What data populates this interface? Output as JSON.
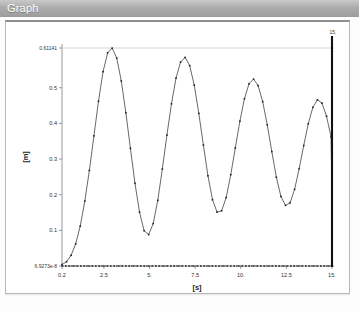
{
  "window": {
    "title": "Graph"
  },
  "chart_data": {
    "type": "line",
    "title": "",
    "xlabel": "[s]",
    "ylabel": "[m]",
    "xlim": [
      0.2,
      15.0
    ],
    "ylim": [
      6.9273e-08,
      0.61141
    ],
    "grid": false,
    "legend": "none",
    "x_tick_labels": [
      "0.2",
      "2.5",
      "5.",
      "7.5",
      "10.",
      "12.5",
      "15."
    ],
    "x_tick_values": [
      0.2,
      2.5,
      5.0,
      7.5,
      10.0,
      12.5,
      15.0
    ],
    "y_tick_labels": [
      "6.9273e-8",
      "0.1",
      "0.2",
      "0.3",
      "0.4",
      "0.5",
      "0.61141"
    ],
    "y_tick_values": [
      6.9273e-08,
      0.1,
      0.2,
      0.3,
      0.4,
      0.5,
      0.61141
    ],
    "marker_line": {
      "x": 15.0,
      "label": "15.",
      "color": "#111111"
    },
    "series": [
      {
        "name": "height",
        "color": "#4d4d4d",
        "marker": "dot",
        "marker_color": "#222222",
        "x": [
          0.2,
          0.45,
          0.7,
          0.95,
          1.2,
          1.45,
          1.7,
          1.95,
          2.2,
          2.45,
          2.7,
          2.95,
          3.2,
          3.45,
          3.7,
          3.95,
          4.2,
          4.45,
          4.7,
          4.95,
          5.2,
          5.45,
          5.7,
          5.95,
          6.2,
          6.45,
          6.7,
          6.95,
          7.2,
          7.45,
          7.7,
          7.95,
          8.2,
          8.45,
          8.7,
          8.95,
          9.2,
          9.45,
          9.7,
          9.95,
          10.2,
          10.45,
          10.7,
          10.95,
          11.2,
          11.45,
          11.7,
          11.95,
          12.2,
          12.45,
          12.7,
          12.95,
          13.2,
          13.45,
          13.7,
          13.95,
          14.2,
          14.45,
          14.7,
          14.95,
          15.0
        ],
        "y": [
          0.004,
          0.012,
          0.03,
          0.062,
          0.112,
          0.182,
          0.268,
          0.365,
          0.462,
          0.545,
          0.598,
          0.611,
          0.583,
          0.519,
          0.43,
          0.33,
          0.232,
          0.151,
          0.099,
          0.088,
          0.119,
          0.184,
          0.272,
          0.367,
          0.455,
          0.527,
          0.572,
          0.585,
          0.562,
          0.507,
          0.428,
          0.339,
          0.253,
          0.186,
          0.151,
          0.155,
          0.192,
          0.256,
          0.331,
          0.406,
          0.469,
          0.511,
          0.524,
          0.506,
          0.461,
          0.396,
          0.321,
          0.249,
          0.195,
          0.17,
          0.177,
          0.215,
          0.273,
          0.338,
          0.399,
          0.445,
          0.466,
          0.457,
          0.42,
          0.362,
          0.192
        ]
      },
      {
        "name": "baseline",
        "color": "#2b2b2b",
        "marker": "dot",
        "marker_color": "#2b2b2b",
        "constant_y": 6.9273e-08
      }
    ]
  }
}
